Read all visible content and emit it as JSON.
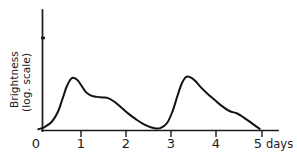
{
  "figure": {
    "background_color": "#ffffff",
    "ink_color": "#121212"
  },
  "axes": {
    "y_axis": {
      "title_line1": "Brightness",
      "title_line2": "(log. scale)",
      "scale": "logarithmic",
      "has_numeric_ticks": false,
      "tick_count": 1
    },
    "x_axis": {
      "unit_label": "days",
      "tick_labels": [
        "0",
        "1",
        "2",
        "3",
        "4",
        "5"
      ],
      "range": [
        0,
        5
      ]
    }
  },
  "chart_data": {
    "type": "line",
    "title": "",
    "subtitle": "",
    "xlabel": "days",
    "ylabel": "Brightness (log. scale)",
    "xlim": [
      0,
      5.2
    ],
    "ylim": [
      0,
      1
    ],
    "grid": false,
    "legend": false,
    "legend_position": "none",
    "y_scale": "log",
    "x_tick_labels": [
      "0",
      "1",
      "2",
      "3",
      "4",
      "5"
    ],
    "x_ticks": [
      0,
      1,
      2,
      3,
      4,
      5
    ],
    "y_ticks": [],
    "annotations": [
      "days"
    ],
    "series": [
      {
        "name": "Brightness",
        "color": "#121212",
        "x": [
          0.05,
          0.2,
          0.35,
          0.48,
          0.58,
          0.68,
          0.78,
          0.86,
          0.93,
          1.0,
          1.1,
          1.22,
          1.35,
          1.5,
          1.62,
          1.75,
          1.9,
          2.05,
          2.2,
          2.4,
          2.6,
          2.75,
          2.9,
          3.02,
          3.12,
          3.22,
          3.32,
          3.42,
          3.52,
          3.65,
          3.8,
          3.95,
          4.1,
          4.28,
          4.45,
          4.6,
          4.78,
          4.95
        ],
        "y": [
          0.015,
          0.045,
          0.105,
          0.22,
          0.37,
          0.53,
          0.625,
          0.63,
          0.6,
          0.545,
          0.465,
          0.42,
          0.405,
          0.398,
          0.385,
          0.34,
          0.27,
          0.2,
          0.14,
          0.07,
          0.03,
          0.028,
          0.09,
          0.23,
          0.4,
          0.56,
          0.645,
          0.64,
          0.6,
          0.52,
          0.44,
          0.37,
          0.3,
          0.235,
          0.205,
          0.155,
          0.085,
          0.02
        ]
      }
    ],
    "features": [
      {
        "name": "first-peak",
        "x": 0.86,
        "y": 0.63
      },
      {
        "name": "shoulder-plateau",
        "x": 1.45,
        "y": 0.4
      },
      {
        "name": "minimum",
        "x": 2.72,
        "y": 0.025
      },
      {
        "name": "second-peak",
        "x": 3.36,
        "y": 0.645
      },
      {
        "name": "tail-shoulder",
        "x": 4.45,
        "y": 0.2
      }
    ]
  }
}
